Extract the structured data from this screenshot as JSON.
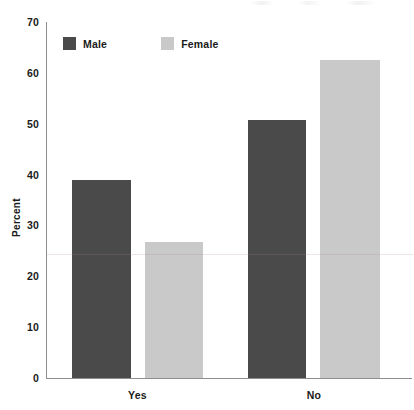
{
  "chart_data": {
    "type": "bar",
    "title": "",
    "subtitle": "",
    "xlabel": "",
    "ylabel": "Percent",
    "categories": [
      "Yes",
      "No"
    ],
    "series": [
      {
        "name": "Male",
        "values": [
          38.9,
          50.7
        ],
        "color": "#4a4a4a"
      },
      {
        "name": "Female",
        "values": [
          26.7,
          62.5
        ],
        "color": "#c9c9c9"
      }
    ],
    "ylim": [
      0,
      70
    ],
    "ytick_labels": [
      "0",
      "10",
      "20",
      "30",
      "40",
      "50",
      "60",
      "70"
    ],
    "ytick_values": [
      0,
      10,
      20,
      30,
      40,
      50,
      60,
      70
    ],
    "grid": false,
    "legend_position": "top-left",
    "legend_entries": [
      "Male",
      "Female"
    ],
    "annotations": []
  },
  "axes": {
    "y_title": "Percent",
    "y_ticks": [
      {
        "label": "70",
        "value": 70
      },
      {
        "label": "60",
        "value": 60
      },
      {
        "label": "50",
        "value": 50
      },
      {
        "label": "40",
        "value": 40
      },
      {
        "label": "30",
        "value": 30
      },
      {
        "label": "20",
        "value": 20
      },
      {
        "label": "10",
        "value": 10
      },
      {
        "label": "0",
        "value": 0
      }
    ],
    "x_categories": [
      {
        "label": "Yes"
      },
      {
        "label": "No"
      }
    ]
  },
  "legend": {
    "items": [
      {
        "label": "Male",
        "color": "#4a4a4a"
      },
      {
        "label": "Female",
        "color": "#c9c9c9"
      }
    ]
  },
  "bars": [
    {
      "name": "bar-male-yes",
      "series": "Male",
      "category": "Yes",
      "value": 38.9,
      "color": "#4a4a4a",
      "x": 72,
      "width": 59
    },
    {
      "name": "bar-female-yes",
      "series": "Female",
      "category": "Yes",
      "value": 26.7,
      "color": "#c9c9c9",
      "x": 145,
      "width": 58
    },
    {
      "name": "bar-male-no",
      "series": "Male",
      "category": "No",
      "value": 50.7,
      "color": "#4a4a4a",
      "x": 248,
      "width": 58
    },
    {
      "name": "bar-female-no",
      "series": "Female",
      "category": "No",
      "value": 62.5,
      "color": "#c9c9c9",
      "x": 320,
      "width": 60
    }
  ],
  "colors": {
    "male": "#4a4a4a",
    "female": "#c9c9c9",
    "axis": "#8d8d8d",
    "text": "#1a1a1a",
    "background": "#ffffff"
  }
}
